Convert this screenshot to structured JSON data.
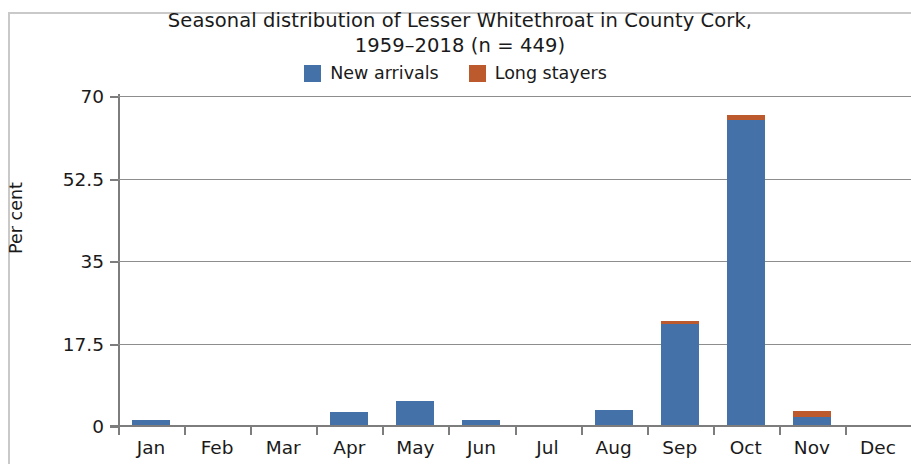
{
  "chart_data": {
    "type": "bar",
    "title": "Seasonal distribution of Lesser Whitethroat in County Cork, 1959–2018 (n = 449)",
    "title_lines": [
      "Seasonal distribution of Lesser Whitethroat in County Cork,",
      "1959–2018 (n = 449)"
    ],
    "xlabel": "",
    "ylabel": "Per cent",
    "categories": [
      "Jan",
      "Feb",
      "Mar",
      "Apr",
      "May",
      "Jun",
      "Jul",
      "Aug",
      "Sep",
      "Oct",
      "Nov",
      "Dec"
    ],
    "series": [
      {
        "name": "New arrivals",
        "color": "#4472a8",
        "values": [
          1.3,
          0,
          0,
          3.0,
          5.3,
          1.3,
          0,
          3.3,
          21.6,
          65.0,
          1.9,
          0
        ]
      },
      {
        "name": "Long stayers",
        "color": "#bc5a2e",
        "values": [
          0,
          0,
          0,
          0,
          0,
          0,
          0,
          0,
          0.7,
          1.0,
          1.3,
          0
        ]
      }
    ],
    "stacked": true,
    "ylim": [
      0,
      70
    ],
    "yticks": [
      0,
      17.5,
      35,
      52.5,
      70
    ],
    "ytick_labels": [
      "0",
      "17.5",
      "35",
      "52.5",
      "70"
    ],
    "grid": true,
    "grid_axis": "y",
    "legend_position": "top-center",
    "legend": [
      {
        "label": "New arrivals",
        "color": "#4472a8"
      },
      {
        "label": "Long stayers",
        "color": "#bc5a2e"
      }
    ]
  }
}
